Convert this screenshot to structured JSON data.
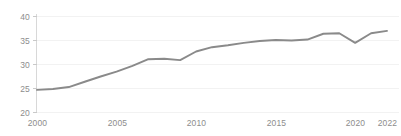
{
  "chart_data": {
    "type": "line",
    "title": "",
    "subtitle": "",
    "xlabel": "",
    "ylabel": "",
    "xlim": [
      2000,
      2022
    ],
    "ylim": [
      20,
      40
    ],
    "grid": true,
    "legend": false,
    "legend_position": "none",
    "line_color": "#8a8a8a",
    "axis_color": "#d8d8d8",
    "grid_color": "#f2f2f2",
    "tick_label_color": "#8d8d8d",
    "background_color": "#ffffff",
    "y_ticks": [
      20,
      25,
      30,
      35,
      40
    ],
    "y_tick_labels": [
      "20",
      "25",
      "30",
      "35",
      "40"
    ],
    "x_ticks": [
      2000,
      2005,
      2010,
      2015,
      2020,
      2022
    ],
    "x_tick_labels": [
      "2000",
      "2005",
      "2010",
      "2015",
      "2020",
      "2022"
    ],
    "x": [
      2000,
      2001,
      2002,
      2003,
      2004,
      2005,
      2006,
      2007,
      2008,
      2009,
      2010,
      2011,
      2012,
      2013,
      2014,
      2015,
      2016,
      2017,
      2018,
      2019,
      2020,
      2021,
      2022
    ],
    "series": [
      {
        "name": "series-1",
        "color": "#8a8a8a",
        "values": [
          24.6,
          24.8,
          25.2,
          26.3,
          27.4,
          28.4,
          29.6,
          31.0,
          31.1,
          30.8,
          32.6,
          33.5,
          33.9,
          34.4,
          34.8,
          35.0,
          34.9,
          35.1,
          36.3,
          36.4,
          34.4,
          36.4,
          36.9
        ]
      }
    ]
  }
}
